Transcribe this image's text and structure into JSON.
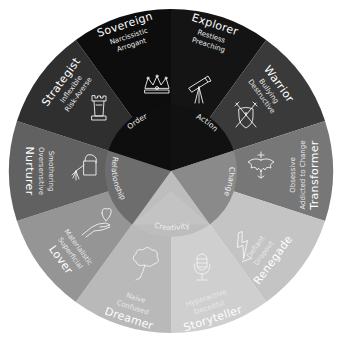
{
  "diagram": {
    "type": "archetype-wheel",
    "center": [
      171,
      171
    ],
    "outer_radius": 162,
    "inner_radius": 66,
    "segments": [
      {
        "id": "explorer",
        "title": "Explorer",
        "traits": [
          "Restless",
          "Preaching"
        ],
        "icon": "telescope-icon",
        "color": "#141414",
        "group": "action"
      },
      {
        "id": "warrior",
        "title": "Warrior",
        "traits": [
          "Bullying",
          "Destructive"
        ],
        "icon": "shield-swords-icon",
        "color": "#3a3a3a",
        "group": "action"
      },
      {
        "id": "transformer",
        "title": "Transformer",
        "traits": [
          "Obsessive",
          "Addicted to Change"
        ],
        "icon": "phoenix-icon",
        "color": "#777777",
        "group": "change"
      },
      {
        "id": "renegade",
        "title": "Renegade",
        "traits": [
          "Defiant",
          "Dropout"
        ],
        "icon": "lightning-bolt-icon",
        "color": "#c4c4c4",
        "group": "change"
      },
      {
        "id": "storyteller",
        "title": "Storyteller",
        "traits": [
          "Hyperactive",
          "Deceitful"
        ],
        "icon": "microphone-icon",
        "color": "#cfcfcf",
        "group": "creativity"
      },
      {
        "id": "dreamer",
        "title": "Dreamer",
        "traits": [
          "Naive",
          "Confused"
        ],
        "icon": "cloud-balloon-icon",
        "color": "#b9b9b9",
        "group": "creativity"
      },
      {
        "id": "lover",
        "title": "Lover",
        "traits": [
          "Materialistic",
          "Superficial"
        ],
        "icon": "heart-hand-icon",
        "color": "#959595",
        "group": "relationship"
      },
      {
        "id": "nurturer",
        "title": "Nurturer",
        "traits": [
          "Smothering",
          "Oversensitive"
        ],
        "icon": "watering-can-icon",
        "color": "#616161",
        "group": "relationship"
      },
      {
        "id": "strategist",
        "title": "Strategist",
        "traits": [
          "Inflexible",
          "Risk-Averse"
        ],
        "icon": "chess-rook-icon",
        "color": "#2f2f2f",
        "group": "order"
      },
      {
        "id": "sovereign",
        "title": "Sovereign",
        "traits": [
          "Narcissistic",
          "Arrogant"
        ],
        "icon": "crown-icon",
        "color": "#0d0d0d",
        "group": "order"
      }
    ],
    "inner_groups": [
      {
        "id": "action",
        "label": "Action",
        "color": "#111111"
      },
      {
        "id": "change",
        "label": "Change",
        "color": "#8a8a8a"
      },
      {
        "id": "creativity",
        "label": "Creativity",
        "color": "#bdbdbd"
      },
      {
        "id": "relationship",
        "label": "Relationship",
        "color": "#6d6d6d"
      },
      {
        "id": "order",
        "label": "Order",
        "color": "#0e0e0e"
      }
    ]
  }
}
